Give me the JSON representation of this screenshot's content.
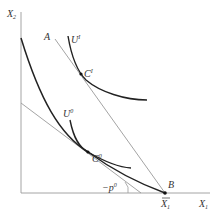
{
  "diagram": {
    "axes": {
      "y_label": "X",
      "y_label_sub": "2",
      "x_label": "X",
      "x_label_sub": "1",
      "x_bar_label": "X",
      "x_bar_label_sub": "1"
    },
    "points": {
      "A": "A",
      "B": "B",
      "C1": "C",
      "C1_sup": "I",
      "C0": "C",
      "C0_sup": "0"
    },
    "curves": {
      "U1": "U",
      "U1_sup": "I",
      "U0": "U",
      "U0_sup": "0"
    },
    "slope_label": "−p",
    "slope_label_sup": "0",
    "colors": {
      "axis": "#9a9a9a",
      "budget_line": "#9a9a9a",
      "curve": "#222222",
      "label": "#333333"
    }
  }
}
